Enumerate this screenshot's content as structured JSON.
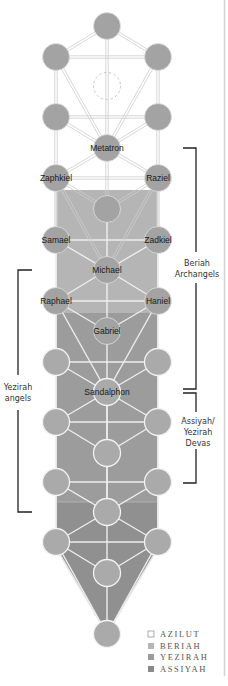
{
  "diagram": {
    "colors": {
      "azilut": "#ffffff",
      "beriah": "#b5b5b5",
      "yezirah": "#9c9c9c",
      "assiyah": "#909090",
      "upper_node": "#a3a3a3",
      "lower_node": "#aaaaaa",
      "path_line": "#c8c8c8",
      "bracket": "#222222",
      "frame": "#d4d4d4"
    },
    "nodes": [
      {
        "x": 107,
        "y": 26,
        "label": ""
      },
      {
        "x": 56,
        "y": 57,
        "label": ""
      },
      {
        "x": 158,
        "y": 57,
        "label": ""
      },
      {
        "x": 107,
        "y": 86,
        "label": "",
        "hidden": true
      },
      {
        "x": 56,
        "y": 117,
        "label": ""
      },
      {
        "x": 158,
        "y": 117,
        "label": ""
      },
      {
        "x": 107,
        "y": 148,
        "label": "Metatron"
      },
      {
        "x": 56,
        "y": 178,
        "label": "Zaphkiel"
      },
      {
        "x": 158,
        "y": 178,
        "label": "Raziel"
      },
      {
        "x": 107,
        "y": 209,
        "label": ""
      },
      {
        "x": 56,
        "y": 240,
        "label": "Samael"
      },
      {
        "x": 158,
        "y": 240,
        "label": "Zadkiel"
      },
      {
        "x": 107,
        "y": 270,
        "label": "Michael"
      },
      {
        "x": 56,
        "y": 301,
        "label": "Raphael"
      },
      {
        "x": 158,
        "y": 301,
        "label": "Haniel"
      },
      {
        "x": 107,
        "y": 331,
        "label": "Gabriel"
      },
      {
        "x": 56,
        "y": 362,
        "label": ""
      },
      {
        "x": 158,
        "y": 362,
        "label": ""
      },
      {
        "x": 107,
        "y": 392,
        "label": "Sandalphon"
      },
      {
        "x": 56,
        "y": 422,
        "label": ""
      },
      {
        "x": 158,
        "y": 422,
        "label": ""
      },
      {
        "x": 107,
        "y": 453,
        "label": ""
      },
      {
        "x": 56,
        "y": 482,
        "label": ""
      },
      {
        "x": 158,
        "y": 482,
        "label": ""
      },
      {
        "x": 107,
        "y": 512,
        "label": ""
      },
      {
        "x": 56,
        "y": 542,
        "label": ""
      },
      {
        "x": 158,
        "y": 542,
        "label": ""
      },
      {
        "x": 107,
        "y": 573,
        "label": ""
      },
      {
        "x": 107,
        "y": 634,
        "label": ""
      }
    ],
    "brackets": {
      "beriah": {
        "label_line1": "Beriah",
        "label_line2": "Archangels"
      },
      "yezirah": {
        "label_line1": "Yezirah",
        "label_line2": "angels"
      },
      "assiyah": {
        "label_line1": "Assiyah/",
        "label_line2": "Yezirah",
        "label_line3": "Devas"
      }
    },
    "legend": [
      {
        "label": "AZILUT",
        "color": "#ffffff"
      },
      {
        "label": "BERIAH",
        "color": "#b5b5b5"
      },
      {
        "label": "YEZIRAH",
        "color": "#9c9c9c"
      },
      {
        "label": "ASSIYAH",
        "color": "#8a8a8a"
      }
    ]
  }
}
